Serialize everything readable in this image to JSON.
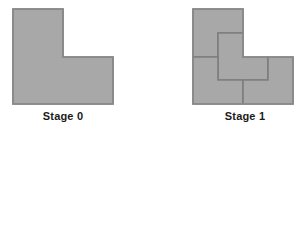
{
  "figure": {
    "background_color": "#ffffff",
    "tile_fill_color": "#a8a8a8",
    "tile_stroke_color": "#7d7d7d",
    "outline_stroke_color": "#8a8a8a",
    "label_color": "#1b1b1b",
    "stroke_width": 1.6
  },
  "stages": [
    {
      "id": "stage-0",
      "label": "Stage 0",
      "shape": "L-tromino",
      "tile_count": 1,
      "outline_points": "13,9 63,9 63,57 113,57 113,104 13,104",
      "tiles": [
        {
          "id": "stage-0-tile-1",
          "name": "whole-L",
          "points": "13,9 63,9 63,57 113,57 113,104 13,104"
        }
      ]
    },
    {
      "id": "stage-1",
      "label": "Stage 1",
      "shape": "L-tromino subdivided into 4 half-scale L-trominoes",
      "tile_count": 4,
      "outline_points": "193,9 243,9 243,57 293,57 293,104 193,104",
      "tiles": [
        {
          "id": "stage-1-tile-1",
          "name": "upper-left-L",
          "points": "193,9 243,9 243,33 218,33 218,57 193,57"
        },
        {
          "id": "stage-1-tile-2",
          "name": "center-L",
          "points": "218,33 243,33 243,57 268,57 268,80 218,80"
        },
        {
          "id": "stage-1-tile-3",
          "name": "lower-left-L",
          "points": "193,57 218,57 218,80 243,80 243,104 193,104"
        },
        {
          "id": "stage-1-tile-4",
          "name": "right-L",
          "points": "268,57 293,57 293,104 243,104 243,80 268,80"
        }
      ]
    }
  ]
}
